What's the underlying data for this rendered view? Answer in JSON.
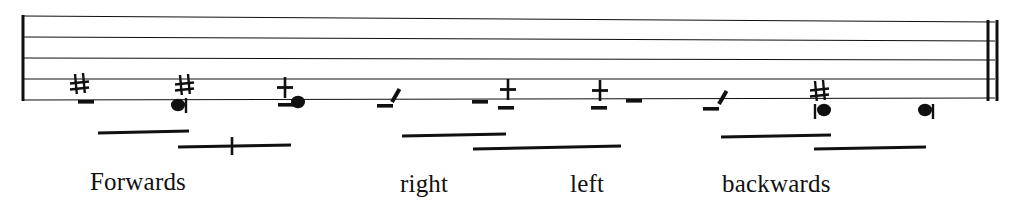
{
  "figure": {
    "kind": "music-notation-staff",
    "width": 1027,
    "height": 208,
    "background_color": "#ffffff",
    "ink_color": "#101010"
  },
  "staff": {
    "line_count": 5,
    "left_x": 23,
    "right_x": 995,
    "left_line_y": [
      16,
      37,
      58,
      79,
      100
    ],
    "right_line_y": [
      22,
      41,
      60,
      79,
      98
    ],
    "left_barline": {
      "x": 23,
      "thickness": 3
    },
    "right_barline": {
      "type": "double-barline",
      "x1": 988,
      "x2": 997,
      "thickness": 3
    }
  },
  "symbols": [
    {
      "id": "sym-1",
      "glyph": "sharp",
      "name": "sharp-sign",
      "x": 79,
      "y": 85
    },
    {
      "id": "sym-2",
      "glyph": "dash",
      "name": "dash-mark",
      "x": 86,
      "y": 102
    },
    {
      "id": "sym-3",
      "glyph": "sharp",
      "name": "sharp-sign",
      "x": 184,
      "y": 86
    },
    {
      "id": "sym-4",
      "glyph": "notehead",
      "name": "notehead",
      "x": 178,
      "y": 105
    },
    {
      "id": "sym-5",
      "glyph": "stem",
      "name": "note-stem",
      "x": 186,
      "y": 105
    },
    {
      "id": "sym-6",
      "glyph": "cross",
      "name": "cross-mark",
      "x": 285,
      "y": 88
    },
    {
      "id": "sym-7",
      "glyph": "dash",
      "name": "dash-mark",
      "x": 286,
      "y": 105
    },
    {
      "id": "sym-8",
      "glyph": "notehead",
      "name": "notehead",
      "x": 298,
      "y": 102
    },
    {
      "id": "sym-9",
      "glyph": "slash",
      "name": "slash-mark",
      "x": 396,
      "y": 95
    },
    {
      "id": "sym-10",
      "glyph": "dash",
      "name": "dash-mark",
      "x": 385,
      "y": 106
    },
    {
      "id": "sym-11",
      "glyph": "dash",
      "name": "dash-mark",
      "x": 480,
      "y": 102
    },
    {
      "id": "sym-12",
      "glyph": "cross",
      "name": "cross-mark",
      "x": 508,
      "y": 90
    },
    {
      "id": "sym-13",
      "glyph": "dash",
      "name": "dash-mark",
      "x": 506,
      "y": 108
    },
    {
      "id": "sym-14",
      "glyph": "cross",
      "name": "cross-mark",
      "x": 600,
      "y": 91
    },
    {
      "id": "sym-15",
      "glyph": "dash",
      "name": "dash-mark",
      "x": 599,
      "y": 108
    },
    {
      "id": "sym-16",
      "glyph": "dash",
      "name": "dash-mark",
      "x": 634,
      "y": 101
    },
    {
      "id": "sym-17",
      "glyph": "slash",
      "name": "slash-mark",
      "x": 723,
      "y": 97
    },
    {
      "id": "sym-18",
      "glyph": "dash",
      "name": "dash-mark",
      "x": 711,
      "y": 109
    },
    {
      "id": "sym-19",
      "glyph": "sharp",
      "name": "sharp-sign",
      "x": 819,
      "y": 92
    },
    {
      "id": "sym-20",
      "glyph": "stem",
      "name": "note-stem",
      "x": 815,
      "y": 111
    },
    {
      "id": "sym-21",
      "glyph": "notehead",
      "name": "notehead",
      "x": 824,
      "y": 110
    },
    {
      "id": "sym-22",
      "glyph": "notehead",
      "name": "notehead",
      "x": 925,
      "y": 110
    },
    {
      "id": "sym-23",
      "glyph": "stem",
      "name": "note-stem",
      "x": 933,
      "y": 111
    }
  ],
  "beams": [
    {
      "id": "beam-1",
      "name": "beam-line",
      "x1": 98,
      "y1": 133,
      "x2": 189,
      "y2": 131,
      "thickness": 3
    },
    {
      "id": "beam-2",
      "name": "beam-line",
      "x1": 178,
      "y1": 147,
      "x2": 291,
      "y2": 145,
      "thickness": 3,
      "cross_at_x": 232
    },
    {
      "id": "beam-3",
      "name": "beam-line",
      "x1": 402,
      "y1": 136,
      "x2": 506,
      "y2": 134,
      "thickness": 3
    },
    {
      "id": "beam-4",
      "name": "beam-line",
      "x1": 473,
      "y1": 149,
      "x2": 621,
      "y2": 146,
      "thickness": 3
    },
    {
      "id": "beam-5",
      "name": "beam-line",
      "x1": 721,
      "y1": 137,
      "x2": 831,
      "y2": 135,
      "thickness": 3
    },
    {
      "id": "beam-6",
      "name": "beam-line",
      "x1": 814,
      "y1": 149,
      "x2": 926,
      "y2": 147,
      "thickness": 3
    }
  ],
  "captions": [
    {
      "id": "cap-forwards",
      "text": "Forwards",
      "x": 90,
      "y": 168
    },
    {
      "id": "cap-right",
      "text": "right",
      "x": 400,
      "y": 170
    },
    {
      "id": "cap-left",
      "text": "left",
      "x": 570,
      "y": 170
    },
    {
      "id": "cap-backwards",
      "text": "backwards",
      "x": 722,
      "y": 170
    }
  ]
}
